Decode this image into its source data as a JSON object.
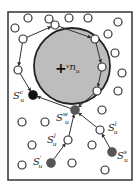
{
  "diagram": {
    "frame": {
      "x": 8,
      "y": 12,
      "width": 124,
      "height": 168,
      "stroke": "#333333"
    },
    "obstacle": {
      "cx": 72,
      "cy": 66,
      "r": 38,
      "fill": "#bdbdbd",
      "stroke": "#222222",
      "center_label": "v",
      "center_label_sub": "n",
      "center_label_subsub": "u",
      "center_marker": "+"
    },
    "colors": {
      "hollow_fill": "#ffffff",
      "hollow_stroke": "#333333",
      "black_node": "#111111",
      "gray_node": "#555555",
      "edge": "#333333"
    },
    "hollow_nodes": [
      {
        "cx": 28,
        "cy": 18
      },
      {
        "cx": 49,
        "cy": 19
      },
      {
        "cx": 69,
        "cy": 18
      },
      {
        "cx": 88,
        "cy": 18
      },
      {
        "cx": 118,
        "cy": 22
      },
      {
        "cx": 15,
        "cy": 28
      },
      {
        "cx": 108,
        "cy": 34
      },
      {
        "cx": 115,
        "cy": 53
      },
      {
        "cx": 122,
        "cy": 73
      },
      {
        "cx": 118,
        "cy": 91
      },
      {
        "cx": 102,
        "cy": 110
      },
      {
        "cx": 22,
        "cy": 122
      },
      {
        "cx": 45,
        "cy": 122
      },
      {
        "cx": 32,
        "cy": 145
      },
      {
        "cx": 92,
        "cy": 145
      },
      {
        "cx": 22,
        "cy": 165
      },
      {
        "cx": 72,
        "cy": 163
      },
      {
        "cx": 105,
        "cy": 170
      }
    ],
    "boundary_nodes": [
      {
        "cx": 55,
        "cy": 25
      },
      {
        "cx": 95,
        "cy": 39
      },
      {
        "cx": 102,
        "cy": 67
      },
      {
        "cx": 97,
        "cy": 91
      },
      {
        "cx": 23,
        "cy": 39
      },
      {
        "cx": 18,
        "cy": 70
      }
    ],
    "labeled_nodes": [
      {
        "id": "Sc",
        "cx": 33,
        "cy": 95,
        "type": "black",
        "label": "S",
        "sub": "u",
        "sup": "c",
        "lx": 13,
        "ly": 99
      },
      {
        "id": "Sw",
        "cx": 75,
        "cy": 110,
        "type": "gray",
        "label": "S",
        "sub": "u",
        "sup": "w",
        "lx": 56,
        "ly": 121
      },
      {
        "id": "Sl_right",
        "cx": 100,
        "cy": 130,
        "type": "hollow",
        "label": "S",
        "sub": "u",
        "sup": "l",
        "lx": 108,
        "ly": 131
      },
      {
        "id": "Sl_left",
        "cx": 68,
        "cy": 140,
        "type": "hollow",
        "label": "S",
        "sub": "u",
        "sup": "l",
        "lx": 47,
        "ly": 143
      },
      {
        "id": "Ss",
        "cx": 112,
        "cy": 152,
        "type": "gray",
        "label": "S",
        "sub": "u",
        "sup": "s",
        "lx": 117,
        "ly": 159
      },
      {
        "id": "Sprime",
        "cx": 51,
        "cy": 163,
        "type": "gray",
        "label": "S",
        "sub": "u",
        "sup": "'",
        "lx": 33,
        "ly": 165
      }
    ],
    "edges": [
      {
        "x1": 23,
        "y1": 39,
        "x2": 55,
        "y2": 25
      },
      {
        "x1": 55,
        "y1": 25,
        "x2": 95,
        "y2": 39
      },
      {
        "x1": 95,
        "y1": 39,
        "x2": 102,
        "y2": 67
      },
      {
        "x1": 102,
        "y1": 67,
        "x2": 97,
        "y2": 91
      },
      {
        "x1": 23,
        "y1": 39,
        "x2": 18,
        "y2": 70
      },
      {
        "x1": 18,
        "y1": 70,
        "x2": 33,
        "y2": 95
      },
      {
        "x1": 97,
        "y1": 91,
        "x2": 75,
        "y2": 110
      },
      {
        "x1": 75,
        "y1": 110,
        "x2": 33,
        "y2": 95
      },
      {
        "x1": 100,
        "y1": 130,
        "x2": 75,
        "y2": 110
      },
      {
        "x1": 112,
        "y1": 152,
        "x2": 100,
        "y2": 130
      },
      {
        "x1": 68,
        "y1": 140,
        "x2": 75,
        "y2": 110
      },
      {
        "x1": 51,
        "y1": 163,
        "x2": 68,
        "y2": 140
      }
    ]
  }
}
